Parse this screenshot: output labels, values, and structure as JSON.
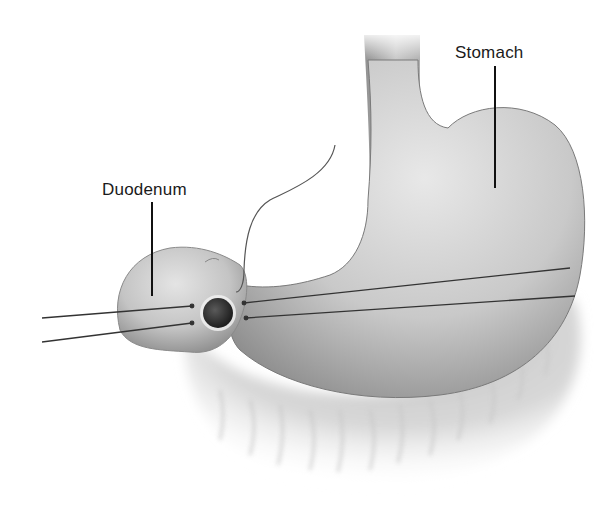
{
  "figure": {
    "type": "anatomical-illustration",
    "labels": {
      "stomach": "Stomach",
      "duodenum": "Duodenum"
    },
    "colors": {
      "background": "#ffffff",
      "organ_light": "#e6e6e6",
      "organ_mid": "#b5b5b5",
      "organ_dark": "#6e6e6e",
      "pylorus": "#2b2b2b",
      "lines": "#333333",
      "label_text": "#1a1a1a"
    }
  }
}
